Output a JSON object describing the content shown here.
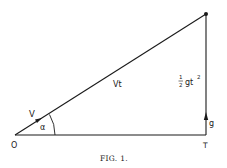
{
  "figure": {
    "caption": "Fig. 1.",
    "caption_display": "FIG. 1.",
    "labels": {
      "origin": "O",
      "foot": "T",
      "velocity": "V",
      "angle": "α",
      "hypotenuse": "Vt",
      "fall_half": "1",
      "fall_half_den": "2",
      "fall_expr": "gt",
      "fall_exp": "2",
      "gravity": "g"
    },
    "colors": {
      "line": "#1a1a1a",
      "background": "#ffffff"
    }
  }
}
